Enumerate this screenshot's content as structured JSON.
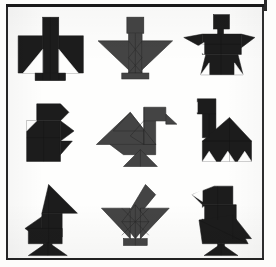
{
  "page": {
    "background_color": "#fefefd",
    "frame_color": "#1e1e1e"
  },
  "palette": {
    "dark_figure": "#1c1c1c",
    "gray_figure": "#444444",
    "piece_outline": "#0e0e0e",
    "gray_piece_outline": "#2b2b2b"
  },
  "grid": {
    "rows": 3,
    "columns": 3,
    "cell_count": 9
  },
  "figures": [
    {
      "index": 1,
      "row": 1,
      "column": 1,
      "name": "cross-bird-figure",
      "label": "Cross Bird",
      "tone": "dark",
      "fill": "#1c1c1c"
    },
    {
      "index": 2,
      "row": 1,
      "column": 2,
      "name": "winged-person-figure",
      "label": "Winged Person",
      "tone": "gray",
      "fill": "#444444"
    },
    {
      "index": 3,
      "row": 1,
      "column": 3,
      "name": "square-head-figure",
      "label": "Square Head Figure",
      "tone": "dark",
      "fill": "#1c1c1c"
    },
    {
      "index": 4,
      "row": 2,
      "column": 1,
      "name": "blocky-bird-figure",
      "label": "Blocky Bird",
      "tone": "dark",
      "fill": "#1c1c1c"
    },
    {
      "index": 5,
      "row": 2,
      "column": 2,
      "name": "duck-figure",
      "label": "Duck",
      "tone": "gray",
      "fill": "#444444"
    },
    {
      "index": 6,
      "row": 2,
      "column": 3,
      "name": "camel-figure",
      "label": "Camel",
      "tone": "dark",
      "fill": "#1c1c1c"
    },
    {
      "index": 7,
      "row": 3,
      "column": 1,
      "name": "rocket-figure",
      "label": "Rocket",
      "tone": "dark",
      "fill": "#1c1c1c"
    },
    {
      "index": 8,
      "row": 3,
      "column": 2,
      "name": "spread-wing-bird-figure",
      "label": "Spread Wing Bird",
      "tone": "gray",
      "fill": "#444444"
    },
    {
      "index": 9,
      "row": 3,
      "column": 3,
      "name": "perched-bird-figure",
      "label": "Perched Bird",
      "tone": "dark",
      "fill": "#1c1c1c"
    }
  ]
}
